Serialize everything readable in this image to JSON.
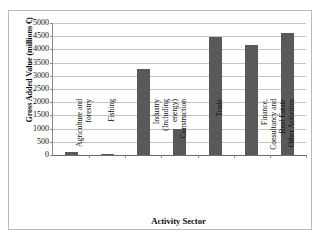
{
  "chart_data": {
    "type": "bar",
    "title": "",
    "xlabel": "Activity Sector",
    "ylabel": "Gross Added Value (millions €)",
    "categories": [
      "Agriculture and forestry",
      "Fishing",
      "Industry (Including energy)",
      "Construction",
      "Trade",
      "Finance, Consultancy and Real Estate",
      "Other Activities"
    ],
    "category_lines": [
      [
        "Agriculture and",
        "forestry"
      ],
      [
        "Fishing"
      ],
      [
        "Industry",
        "(Including",
        "energy)"
      ],
      [
        "Construction"
      ],
      [
        "Trade"
      ],
      [
        "Finance,",
        "Consultancy and",
        "Real Estate"
      ],
      [
        "Other Activities"
      ]
    ],
    "values": [
      100,
      30,
      3240,
      1000,
      4480,
      4160,
      4610
    ],
    "ylim": [
      0,
      5000
    ],
    "ytick_values": [
      5000,
      4500,
      4000,
      3500,
      3000,
      2500,
      2000,
      1500,
      1000,
      500,
      0
    ],
    "ytick_labels": [
      "5000",
      "4500",
      "4000",
      "3500",
      "3000",
      "2500",
      "2000",
      "1500",
      "1000",
      "500",
      "0"
    ],
    "grid": true,
    "legend": false,
    "bar_color": "#595959",
    "gridline_color": "#c4c4c4",
    "axis_color": "#8a8a8a",
    "background_color": "#ffffff",
    "border_color": "#b9b9b9"
  }
}
